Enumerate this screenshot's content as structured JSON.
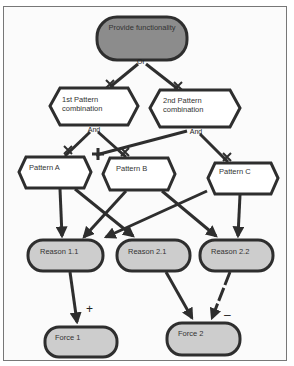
{
  "diagram": {
    "goal": {
      "label": "Provide functionality",
      "fill": "#8c8c8c"
    },
    "decomposition_goal": "Or",
    "combinations": [
      {
        "label_line1": "1st Pattern",
        "label_line2": "combination",
        "decomposition": "And"
      },
      {
        "label_line1": "2nd Pattern",
        "label_line2": "combination",
        "decomposition": "And"
      }
    ],
    "patterns": [
      {
        "label": "Pattern A"
      },
      {
        "label": "Pattern B"
      },
      {
        "label": "Pattern C"
      }
    ],
    "reasons": [
      {
        "label": "Reason 1.1",
        "fill": "#cdcdcd"
      },
      {
        "label": "Reason 2.1",
        "fill": "#cdcdcd"
      },
      {
        "label": "Reason 2.2",
        "fill": "#cdcdcd"
      }
    ],
    "forces": [
      {
        "label": "Force 1",
        "fill": "#cdcdcd"
      },
      {
        "label": "Force 2",
        "fill": "#cdcdcd"
      }
    ],
    "contributions": {
      "reason11_to_force1": "+",
      "reason22_to_force2": "–"
    },
    "colors": {
      "stroke": "#2e2e2e",
      "goal_fill": "#8c8c8c",
      "softgoal_fill": "#cdcdcd",
      "task_fill": "#ffffff"
    }
  }
}
